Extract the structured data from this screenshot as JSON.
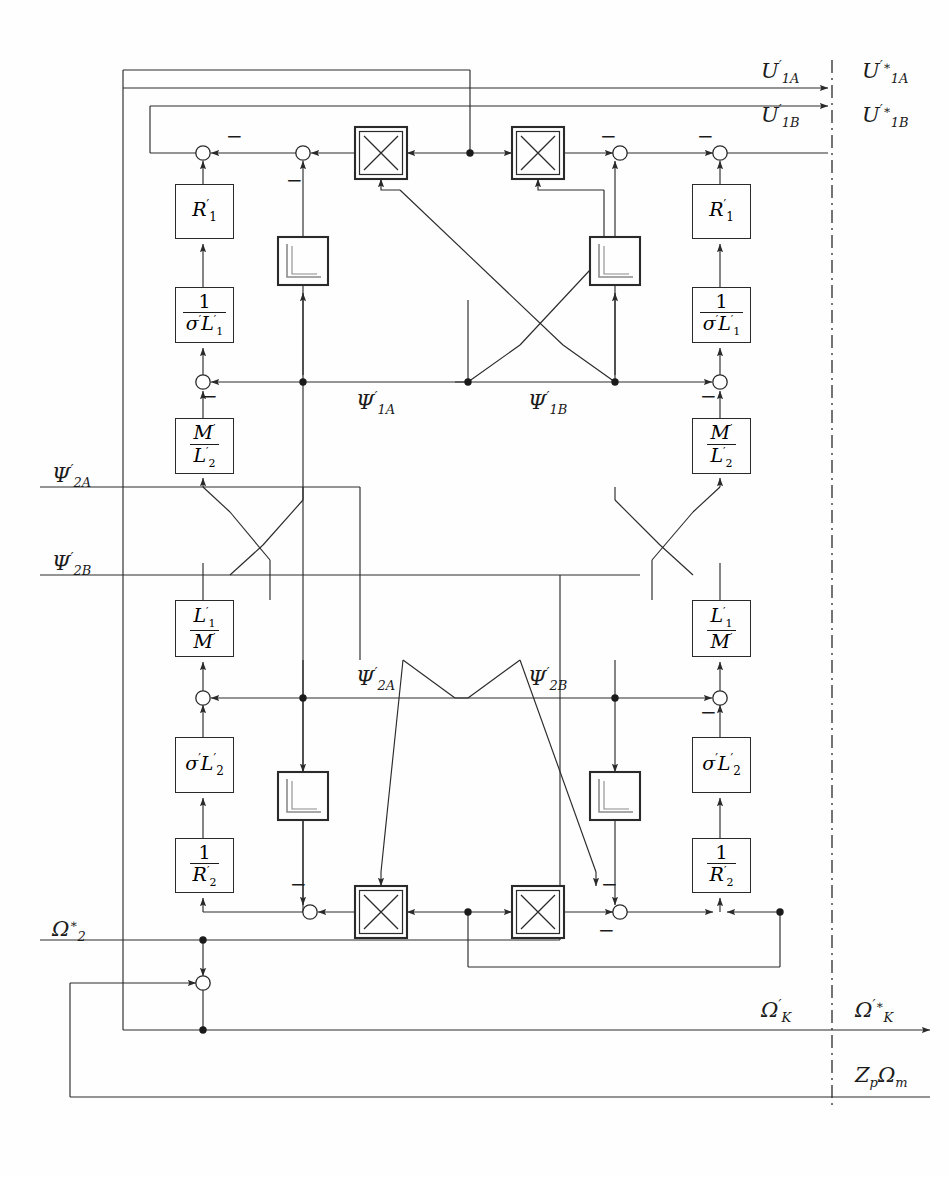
{
  "diagram": {
    "stroke_color": "#2a2a2a",
    "background": "#fefefe",
    "canvas": {
      "width": 951,
      "height": 1177
    }
  },
  "signals": {
    "u1a_in": "U'1A",
    "u1a_out": "U'*1A",
    "u1b_in": "U'1B",
    "u1b_out": "U'*1B",
    "psi1a": "Ψ'1A",
    "psi1b": "Ψ'1B",
    "psi2a_left": "Ψ'2A",
    "psi2b_left": "Ψ'2B",
    "psi2a_mid": "Ψ'2A",
    "psi2b_mid": "Ψ'2B",
    "omega2": "Ω*2",
    "omegaK_in": "Ω'K",
    "omegaK_out": "Ω'*K",
    "zpOmegaM": "ZpΩm"
  },
  "labels": [
    {
      "id": "u1a-in",
      "base": "U",
      "prime": true,
      "sub": "1A",
      "star": false,
      "x": 760,
      "y": 66
    },
    {
      "id": "u1a-out",
      "base": "U",
      "prime": true,
      "sub": "1A",
      "star": true,
      "x": 862,
      "y": 66
    },
    {
      "id": "u1b-in",
      "base": "U",
      "prime": true,
      "sub": "1B",
      "star": false,
      "x": 760,
      "y": 110
    },
    {
      "id": "u1b-out",
      "base": "U",
      "prime": true,
      "sub": "1B",
      "star": true,
      "x": 862,
      "y": 110
    },
    {
      "id": "psi1a",
      "base": "Ψ",
      "prime": true,
      "sub": "1A",
      "star": false,
      "x": 355,
      "y": 389
    },
    {
      "id": "psi1b",
      "base": "Ψ",
      "prime": true,
      "sub": "1B",
      "star": false,
      "x": 527,
      "y": 389
    },
    {
      "id": "psi2a-l",
      "base": "Ψ",
      "prime": true,
      "sub": "2A",
      "star": false,
      "x": 52,
      "y": 463
    },
    {
      "id": "psi2b-l",
      "base": "Ψ",
      "prime": true,
      "sub": "2B",
      "star": false,
      "x": 52,
      "y": 551
    },
    {
      "id": "psi2a-m",
      "base": "Ψ",
      "prime": true,
      "sub": "2A",
      "star": false,
      "x": 355,
      "y": 665
    },
    {
      "id": "psi2b-m",
      "base": "Ψ",
      "prime": true,
      "sub": "2B",
      "star": false,
      "x": 527,
      "y": 665
    },
    {
      "id": "omega2",
      "base": "Ω",
      "prime": false,
      "sub": "2",
      "star": true,
      "x": 52,
      "y": 920
    },
    {
      "id": "omegak-in",
      "base": "Ω",
      "prime": true,
      "sub": "K",
      "star": false,
      "x": 760,
      "y": 1000
    },
    {
      "id": "omegak-out",
      "base": "Ω",
      "prime": true,
      "sub": "K",
      "star": true,
      "x": 855,
      "y": 1000
    },
    {
      "id": "zpomegam",
      "base": "Z",
      "prime": false,
      "sub": "p",
      "star": false,
      "x": 855,
      "y": 1068
    }
  ],
  "blocks": [
    {
      "id": "r1-left",
      "kind": "gain",
      "type": "plain",
      "text": "R'1",
      "x": 175,
      "y": 184,
      "w": 57,
      "h": 53
    },
    {
      "id": "sl1-left",
      "kind": "gain",
      "type": "frac",
      "num": "1",
      "den": "σ'L'1",
      "x": 175,
      "y": 287,
      "w": 57,
      "h": 54
    },
    {
      "id": "ml2-left",
      "kind": "gain",
      "type": "frac",
      "num": "M'",
      "den": "L'2",
      "x": 175,
      "y": 418,
      "w": 57,
      "h": 54
    },
    {
      "id": "l1m-left",
      "kind": "gain",
      "type": "frac",
      "num": "L'1",
      "den": "M'",
      "x": 175,
      "y": 600,
      "w": 57,
      "h": 55
    },
    {
      "id": "sl2-left",
      "kind": "gain",
      "type": "plain",
      "text": "σ'L'2",
      "x": 175,
      "y": 737,
      "w": 57,
      "h": 54
    },
    {
      "id": "r2-left",
      "kind": "gain",
      "type": "frac",
      "num": "1",
      "den": "R'2",
      "x": 175,
      "y": 838,
      "w": 57,
      "h": 53
    },
    {
      "id": "r1-right",
      "kind": "gain",
      "type": "plain",
      "text": "R'1",
      "x": 692,
      "y": 184,
      "w": 57,
      "h": 53
    },
    {
      "id": "sl1-right",
      "kind": "gain",
      "type": "frac",
      "num": "1",
      "den": "σ'L'1",
      "x": 692,
      "y": 287,
      "w": 57,
      "h": 54
    },
    {
      "id": "ml2-right",
      "kind": "gain",
      "type": "frac",
      "num": "M'",
      "den": "L'2",
      "x": 692,
      "y": 418,
      "w": 57,
      "h": 54
    },
    {
      "id": "l1m-right",
      "kind": "gain",
      "type": "frac",
      "num": "L'1",
      "den": "M'",
      "x": 692,
      "y": 600,
      "w": 57,
      "h": 55
    },
    {
      "id": "sl2-right",
      "kind": "gain",
      "type": "plain",
      "text": "σ'L'2",
      "x": 692,
      "y": 737,
      "w": 57,
      "h": 54
    },
    {
      "id": "r2-right",
      "kind": "gain",
      "type": "frac",
      "num": "1",
      "den": "R'2",
      "x": 692,
      "y": 838,
      "w": 57,
      "h": 53
    },
    {
      "id": "integ-tl",
      "kind": "integrator",
      "x": 278,
      "y": 237,
      "w": 50,
      "h": 48
    },
    {
      "id": "integ-tr",
      "kind": "integrator",
      "x": 590,
      "y": 237,
      "w": 50,
      "h": 48
    },
    {
      "id": "integ-bl",
      "kind": "integrator",
      "x": 278,
      "y": 772,
      "w": 50,
      "h": 48
    },
    {
      "id": "integ-br",
      "kind": "integrator",
      "x": 590,
      "y": 772,
      "w": 50,
      "h": 48
    },
    {
      "id": "mult-tl",
      "kind": "multiplier",
      "x": 355,
      "y": 127,
      "w": 52,
      "h": 52
    },
    {
      "id": "mult-tr",
      "kind": "multiplier",
      "x": 512,
      "y": 127,
      "w": 52,
      "h": 52
    },
    {
      "id": "mult-bl",
      "kind": "multiplier",
      "x": 355,
      "y": 886,
      "w": 52,
      "h": 52
    },
    {
      "id": "mult-br",
      "kind": "multiplier",
      "x": 512,
      "y": 886,
      "w": 52,
      "h": 52
    }
  ],
  "sum_nodes": [
    {
      "id": "sum-tl-a",
      "x": 203,
      "y": 153
    },
    {
      "id": "sum-tl-b",
      "x": 303,
      "y": 153
    },
    {
      "id": "sum-tr-b",
      "x": 620,
      "y": 153
    },
    {
      "id": "sum-tr-a",
      "x": 720,
      "y": 153
    },
    {
      "id": "sum-ml-l",
      "x": 203,
      "y": 382
    },
    {
      "id": "sum-ml-r",
      "x": 720,
      "y": 382
    },
    {
      "id": "sum-bl-l",
      "x": 203,
      "y": 698
    },
    {
      "id": "sum-bl-r",
      "x": 720,
      "y": 698
    },
    {
      "id": "sum-mx-l",
      "x": 310,
      "y": 912
    },
    {
      "id": "sum-mx-r",
      "x": 620,
      "y": 912
    },
    {
      "id": "sum-omega",
      "x": 203,
      "y": 983
    }
  ],
  "minus_marks": [
    {
      "id": "m1",
      "x": 226,
      "y": 132
    },
    {
      "id": "m2",
      "x": 286,
      "y": 176
    },
    {
      "id": "m3",
      "x": 600,
      "y": 132
    },
    {
      "id": "m4",
      "x": 694,
      "y": 132
    },
    {
      "id": "m5",
      "x": 202,
      "y": 390
    },
    {
      "id": "m6",
      "x": 700,
      "y": 390
    },
    {
      "id": "m7",
      "x": 700,
      "y": 706
    },
    {
      "id": "m8",
      "x": 289,
      "y": 880
    },
    {
      "id": "m9",
      "x": 600,
      "y": 880
    },
    {
      "id": "m10",
      "x": 598,
      "y": 925
    }
  ],
  "icon_names": {
    "multiplier": "multiplier-x-icon",
    "integrator": "integrator-step-icon",
    "sum": "summing-junction-icon",
    "junction": "junction-dot-icon",
    "arrow": "arrowhead-icon",
    "boundary": "dash-dot-boundary-line"
  }
}
